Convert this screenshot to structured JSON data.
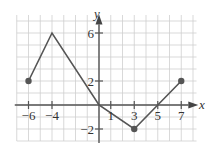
{
  "chart_data": {
    "type": "line",
    "title": "",
    "xlabel": "x",
    "ylabel": "y",
    "xlim": [
      -7,
      7.5
    ],
    "ylim": [
      -3,
      7
    ],
    "grid": true,
    "x_ticks": [
      -6,
      -4,
      1,
      3,
      5,
      7
    ],
    "x_tick_labels": [
      "−6",
      "−4",
      "1",
      "3",
      "5",
      "7"
    ],
    "y_ticks": [
      6,
      2,
      -2
    ],
    "y_tick_labels": [
      "6",
      "2",
      "−2"
    ],
    "series": [
      {
        "name": "f(x)",
        "x": [
          -6,
          -4,
          0,
          3,
          7
        ],
        "y": [
          2,
          6,
          0,
          -2,
          2
        ],
        "color": "#555555",
        "endpoints_closed": [
          [
            -6,
            2
          ],
          [
            3,
            -2
          ],
          [
            7,
            2
          ]
        ]
      }
    ]
  },
  "labels": {
    "x_axis": "x",
    "y_axis": "y",
    "x_ticks": [
      "−6",
      "−4",
      "1",
      "3",
      "5",
      "7"
    ],
    "y_ticks": [
      "6",
      "2",
      "−2"
    ]
  }
}
